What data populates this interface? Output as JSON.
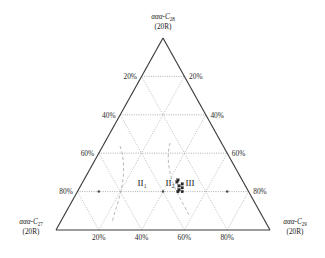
{
  "figure": {
    "type": "ternary-diagram"
  },
  "vertices": {
    "top": {
      "prefix": "ααα-C",
      "sub": "28",
      "line2": "(20R)"
    },
    "left": {
      "prefix": "ααα-C",
      "sub": "27",
      "line2": "(20R)"
    },
    "right": {
      "prefix": "ααα-C",
      "sub": "29",
      "line2": "(20R)"
    }
  },
  "axes": {
    "left_ticks": [
      "20%",
      "40%",
      "60%",
      "80%"
    ],
    "right_ticks": [
      "20%",
      "40%",
      "60%",
      "80%"
    ],
    "bottom_ticks": [
      "20%",
      "40%",
      "60%",
      "80%"
    ]
  },
  "regions": [
    {
      "id": "region-2-1",
      "label": "II",
      "sub": "1"
    },
    {
      "id": "region-2-2",
      "label": "II",
      "sub": "2"
    },
    {
      "id": "region-3",
      "label": "III",
      "sub": ""
    }
  ],
  "chart_data": {
    "type": "scatter",
    "title": "",
    "xlabel": "",
    "ylabel": "",
    "axis_min": 0,
    "axis_max": 100,
    "grid": true,
    "legend": "none",
    "components": [
      "ααα-C27 (20R)",
      "ααα-C28 (20R)",
      "ααα-C29 (20R)"
    ],
    "series": [
      {
        "name": "samples",
        "marker": "square",
        "color": "#2a2a2a",
        "points": [
          {
            "c27": 30,
            "c28": 26,
            "c29": 44
          },
          {
            "c27": 31,
            "c28": 25,
            "c29": 44
          },
          {
            "c27": 29,
            "c28": 24,
            "c29": 47
          },
          {
            "c27": 31,
            "c28": 23,
            "c29": 46
          },
          {
            "c27": 30,
            "c28": 22,
            "c29": 48
          },
          {
            "c27": 32,
            "c28": 21,
            "c29": 47
          },
          {
            "c27": 31,
            "c28": 20,
            "c29": 49
          },
          {
            "c27": 33,
            "c28": 20,
            "c29": 47
          }
        ]
      }
    ],
    "boundary_curves": [
      {
        "name": "II1-II2 boundary",
        "style": "dashed"
      },
      {
        "name": "II2-III boundary",
        "style": "dashed"
      }
    ]
  },
  "colors": {
    "axis": "#3b3b3b",
    "grid": "#8a8a8a",
    "marker": "#2a2a2a",
    "text": "#1a1a1a",
    "background": "#ffffff"
  }
}
